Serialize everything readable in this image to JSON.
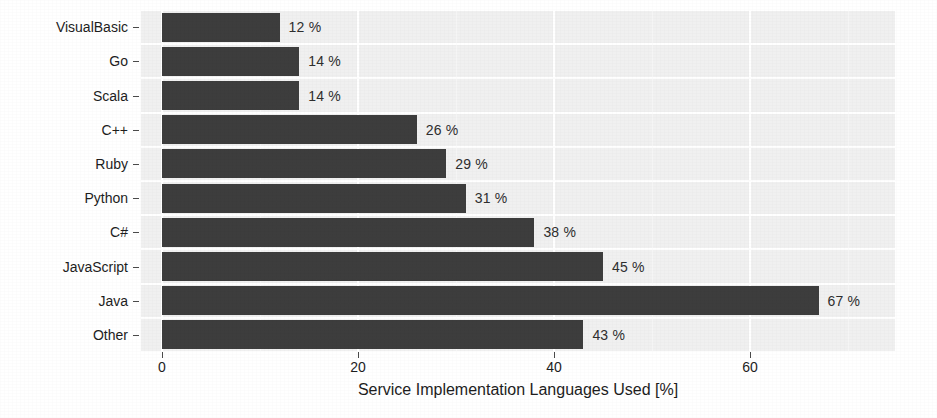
{
  "chart_data": {
    "type": "bar",
    "orientation": "horizontal",
    "title": "",
    "xlabel": "Service Implementation Languages Used [%]",
    "ylabel": "",
    "categories": [
      "VisualBasic",
      "Go",
      "Scala",
      "C++",
      "Ruby",
      "Python",
      "C#",
      "JavaScript",
      "Java",
      "Other"
    ],
    "values": [
      12,
      14,
      14,
      26,
      29,
      31,
      38,
      45,
      67,
      43
    ],
    "value_labels": [
      "12 %",
      "14 %",
      "14 %",
      "26 %",
      "29 %",
      "31 %",
      "38 %",
      "45 %",
      "67 %",
      "43 %"
    ],
    "value_suffix": "%",
    "xlim": [
      0,
      74.8
    ],
    "xticks": [
      0,
      20,
      40,
      60
    ],
    "xtick_labels": [
      "0",
      "20",
      "40",
      "60"
    ],
    "grid": {
      "major_x": true,
      "minor_x": true,
      "major_y": true,
      "color": "#ffffff"
    },
    "legend": null,
    "colors": {
      "bar": "#3d3d3d",
      "panel_background": "#f0f0f0",
      "figure_background": "#ffffff",
      "gridline": "#ffffff",
      "text": "#1d1d1d",
      "value_label": "#2e2e2e",
      "tick_mark": "#4a4a4a"
    }
  }
}
